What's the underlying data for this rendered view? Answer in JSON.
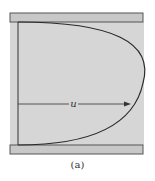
{
  "figure": {
    "caption": "(a)",
    "velocity_label": "u",
    "colors": {
      "fluid": "#d6d6d6",
      "plate": "#c8c8c8",
      "outline": "#444444",
      "profile": "#2a2a2a"
    }
  }
}
